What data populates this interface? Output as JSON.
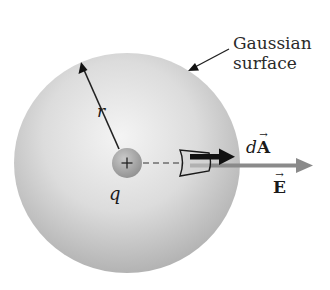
{
  "figure": {
    "caption_line1": "Gaussian",
    "caption_line2": "surface",
    "radius_label": "r",
    "charge_sign": "+",
    "charge_label": "q",
    "area_vector": {
      "prefix": "d",
      "symbol": "A",
      "arrow": "→"
    },
    "field_vector": {
      "symbol": "E",
      "arrow": "→"
    }
  },
  "colors": {
    "sphere_light": "#f2f2f2",
    "sphere_dark": "#b5b5b5",
    "charge_fill": "#a8a8a8",
    "area_arrow": "#111111",
    "field_arrow": "#8a8a8a",
    "line": "#222222"
  },
  "geometry": {
    "sphere_center": [
      127,
      163
    ],
    "sphere_radius": 111,
    "charge_radius": 15,
    "patch_center": [
      194,
      162
    ]
  }
}
